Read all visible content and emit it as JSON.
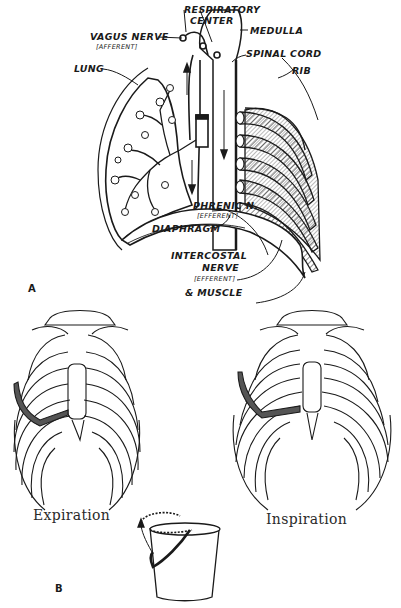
{
  "panel_a": {
    "letter": "A",
    "labels": {
      "respiratory_center_line1": "RESPIRATORY",
      "respiratory_center_line2": "CENTER",
      "vagus_nerve": "VAGUS NERVE",
      "vagus_nerve_sub": "[AFFERENT]",
      "medulla": "MEDULLA",
      "spinal_cord": "SPINAL CORD",
      "lung": "LUNG",
      "rib": "RIB",
      "phrenic_nerve": "PHRENIC N.",
      "phrenic_nerve_sub": "[EFFERENT]",
      "diaphragm": "DIAPHRAGM",
      "intercostal_line1": "INTERCOSTAL",
      "intercostal_line2": "NERVE",
      "intercostal_sub": "[EFFERENT]",
      "muscle": "& MUSCLE"
    }
  },
  "panel_b": {
    "letter": "B",
    "captions": {
      "expiration": "Expiration",
      "inspiration": "Inspiration"
    }
  },
  "colors": {
    "ink": "#1a1a1a",
    "background": "#ffffff",
    "hatched_rib": "#555555"
  }
}
